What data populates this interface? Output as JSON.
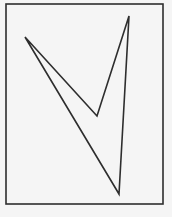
{
  "diagram": {
    "background_color": "#f5f5f5",
    "stroke_color": "#2e2e2e",
    "frame": {
      "x": 6,
      "y": 4,
      "width": 157,
      "height": 200,
      "stroke_width": 1.6
    },
    "shape": {
      "type": "concave-quadrilateral",
      "vertices": [
        {
          "name": "left",
          "x": 25,
          "y": 37
        },
        {
          "name": "inner",
          "x": 97,
          "y": 116
        },
        {
          "name": "top-right",
          "x": 129,
          "y": 16
        },
        {
          "name": "bottom",
          "x": 119,
          "y": 194
        }
      ],
      "stroke_width": 1.6
    }
  }
}
